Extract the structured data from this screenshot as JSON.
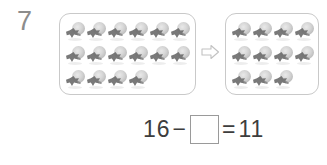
{
  "worksheet": {
    "problem_number": "7",
    "background_color": "#ffffff",
    "ink_color": "#3d3d3d",
    "box_border_color": "#c9c9c9"
  },
  "groups": {
    "start": {
      "label": "starting-group",
      "total_count": 16,
      "rows": [
        6,
        6,
        4
      ],
      "object_icon": "flower-icon"
    },
    "result": {
      "label": "result-group",
      "total_count": 11,
      "rows": [
        4,
        4,
        3
      ],
      "object_icon": "flower-icon"
    }
  },
  "arrow": {
    "name": "right-arrow-icon",
    "direction": "right",
    "color": "#bdbdbd"
  },
  "equation": {
    "minuend": "16",
    "minus_sign": "−",
    "answer_box_value": "",
    "equals_sign": "=",
    "difference": "11",
    "answer_box_border_color": "#9a9a9a"
  },
  "chart_data": {
    "type": "bar",
    "title": "16 − ? = 11",
    "categories": [
      "Starting group",
      "Result group"
    ],
    "values": [
      16,
      11
    ],
    "xlabel": "",
    "ylabel": "Number of objects",
    "ylim": [
      0,
      16
    ],
    "annotations": [
      "Rows in starting group: 6, 6, 4",
      "Rows in result group: 4, 4, 3"
    ]
  }
}
